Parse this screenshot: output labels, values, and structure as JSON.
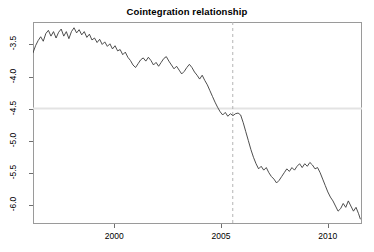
{
  "chart_data": {
    "type": "line",
    "title": "Cointegration relationship",
    "xlabel": "",
    "ylabel": "",
    "xlim": [
      1996.2,
      2011.6
    ],
    "ylim": [
      -6.3,
      -3.15
    ],
    "grid": false,
    "legend": null,
    "xticks": [
      2000,
      2005,
      2010
    ],
    "xtick_labels": [
      "2000",
      "2005",
      "2010"
    ],
    "yticks": [
      -3.5,
      -4.0,
      -4.5,
      -5.0,
      -5.5,
      -6.0
    ],
    "ytick_labels": [
      "-3.5",
      "-4.0",
      "-4.5",
      "-5.0",
      "-5.5",
      "-6.0"
    ],
    "annotations": [
      {
        "name": "break-date-line",
        "type": "vline",
        "x": 2005.55,
        "style": "dashed",
        "color": "#b5b5b5"
      },
      {
        "name": "mean-level-line",
        "type": "hline",
        "y": -4.5,
        "style": "solid",
        "color": "#e3e3e3"
      }
    ],
    "series": [
      {
        "name": "cointegration residual",
        "color": "#3a3a3a",
        "x": [
          1996.2,
          1996.32,
          1996.44,
          1996.56,
          1996.68,
          1996.8,
          1996.92,
          1997.04,
          1997.16,
          1997.28,
          1997.4,
          1997.52,
          1997.64,
          1997.76,
          1997.88,
          1998.0,
          1998.12,
          1998.24,
          1998.36,
          1998.48,
          1998.6,
          1998.72,
          1998.84,
          1998.96,
          1999.08,
          1999.2,
          1999.32,
          1999.44,
          1999.56,
          1999.68,
          1999.8,
          1999.92,
          2000.04,
          2000.16,
          2000.28,
          2000.4,
          2000.52,
          2000.64,
          2000.76,
          2000.88,
          2001.0,
          2001.12,
          2001.24,
          2001.36,
          2001.48,
          2001.6,
          2001.72,
          2001.84,
          2001.96,
          2002.08,
          2002.2,
          2002.32,
          2002.44,
          2002.56,
          2002.68,
          2002.8,
          2002.92,
          2003.04,
          2003.16,
          2003.28,
          2003.4,
          2003.52,
          2003.64,
          2003.76,
          2003.88,
          2004.0,
          2004.12,
          2004.24,
          2004.36,
          2004.48,
          2004.6,
          2004.72,
          2004.84,
          2004.96,
          2005.08,
          2005.2,
          2005.32,
          2005.44,
          2005.56,
          2005.68,
          2005.8,
          2005.92,
          2006.04,
          2006.16,
          2006.28,
          2006.4,
          2006.52,
          2006.64,
          2006.76,
          2006.88,
          2007.0,
          2007.12,
          2007.24,
          2007.36,
          2007.48,
          2007.6,
          2007.72,
          2007.84,
          2007.96,
          2008.08,
          2008.2,
          2008.32,
          2008.44,
          2008.56,
          2008.68,
          2008.8,
          2008.92,
          2009.04,
          2009.16,
          2009.28,
          2009.4,
          2009.52,
          2009.64,
          2009.76,
          2009.88,
          2010.0,
          2010.12,
          2010.24,
          2010.36,
          2010.48,
          2010.6,
          2010.72,
          2010.84,
          2010.96,
          2011.08,
          2011.2,
          2011.32,
          2011.44,
          2011.52
        ],
        "y": [
          -3.63,
          -3.52,
          -3.44,
          -3.38,
          -3.45,
          -3.33,
          -3.28,
          -3.37,
          -3.3,
          -3.4,
          -3.31,
          -3.26,
          -3.37,
          -3.3,
          -3.41,
          -3.3,
          -3.24,
          -3.32,
          -3.27,
          -3.35,
          -3.3,
          -3.39,
          -3.34,
          -3.43,
          -3.4,
          -3.47,
          -3.42,
          -3.5,
          -3.46,
          -3.53,
          -3.49,
          -3.57,
          -3.52,
          -3.6,
          -3.58,
          -3.66,
          -3.62,
          -3.7,
          -3.75,
          -3.82,
          -3.86,
          -3.8,
          -3.74,
          -3.71,
          -3.76,
          -3.7,
          -3.75,
          -3.82,
          -3.78,
          -3.84,
          -3.78,
          -3.72,
          -3.69,
          -3.76,
          -3.82,
          -3.88,
          -3.84,
          -3.9,
          -3.96,
          -3.92,
          -3.86,
          -3.81,
          -3.86,
          -3.93,
          -3.98,
          -4.04,
          -3.98,
          -4.06,
          -4.13,
          -4.22,
          -4.31,
          -4.4,
          -4.48,
          -4.55,
          -4.6,
          -4.56,
          -4.62,
          -4.58,
          -4.61,
          -4.58,
          -4.57,
          -4.6,
          -4.72,
          -4.86,
          -5.0,
          -5.14,
          -5.26,
          -5.36,
          -5.44,
          -5.4,
          -5.46,
          -5.42,
          -5.5,
          -5.56,
          -5.6,
          -5.66,
          -5.62,
          -5.56,
          -5.5,
          -5.44,
          -5.48,
          -5.42,
          -5.46,
          -5.4,
          -5.36,
          -5.42,
          -5.36,
          -5.4,
          -5.34,
          -5.38,
          -5.44,
          -5.42,
          -5.5,
          -5.6,
          -5.7,
          -5.8,
          -5.88,
          -5.94,
          -6.02,
          -6.1,
          -6.06,
          -5.98,
          -6.04,
          -5.94,
          -6.02,
          -6.1,
          -6.04,
          -6.14,
          -6.22
        ]
      }
    ]
  }
}
